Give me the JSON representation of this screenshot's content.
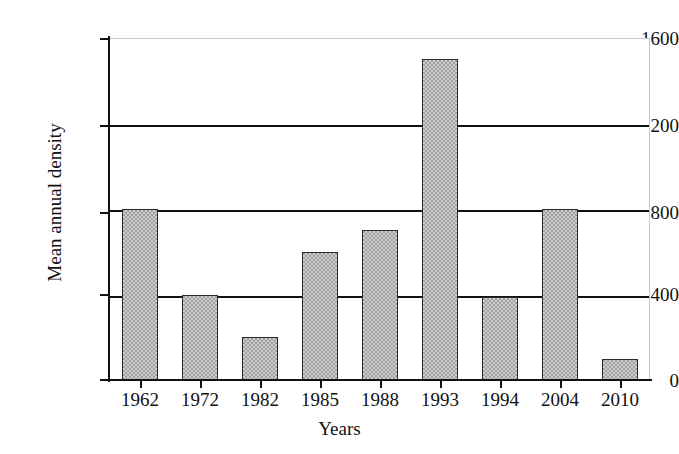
{
  "chart_data": {
    "type": "bar",
    "title": "",
    "subtitle": "",
    "xlabel": "Years",
    "ylabel": "Mean annual density",
    "categories": [
      "1962",
      "1972",
      "1982",
      "1985",
      "1988",
      "1993",
      "1994",
      "2004",
      "2010"
    ],
    "values": [
      800,
      400,
      200,
      600,
      700,
      1500,
      390,
      800,
      100
    ],
    "series": [
      {
        "name": "Mean annual density",
        "values": [
          800,
          400,
          200,
          600,
          700,
          1500,
          390,
          800,
          100
        ]
      }
    ],
    "ylim": [
      0,
      1600
    ],
    "yticks": [
      0,
      400,
      800,
      1200,
      1600
    ],
    "ytick_labels": [
      "0",
      "400",
      "800",
      "1200",
      "1600"
    ],
    "grid": "horizontal",
    "gridlines_at": [
      400,
      800,
      1200
    ],
    "legend": null,
    "legend_position": "none",
    "annotations": [],
    "colors": {
      "bar_fill": "#9e9e9e",
      "bar_pattern": "#cfcfcf",
      "bar_edge": "#2a2a2a",
      "axis": "#111111",
      "gridline": "#111111",
      "frame": "#c9c9c9",
      "background": "#ffffff",
      "text": "#111111"
    }
  }
}
